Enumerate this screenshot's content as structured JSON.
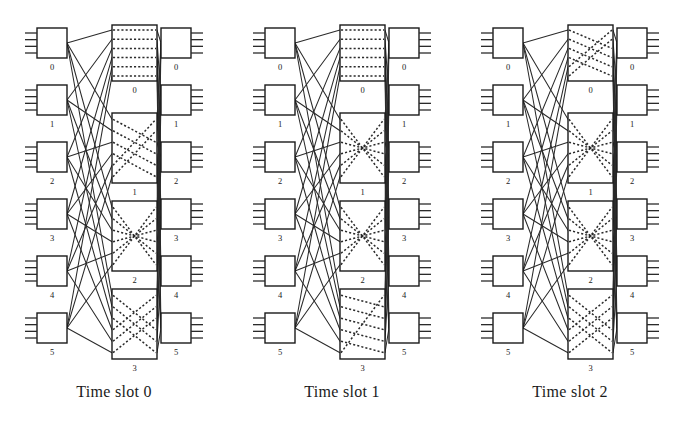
{
  "figure": {
    "type": "three-stage-clos-network-time-slots",
    "background": "#ffffff",
    "line_color": "#2a2a2a",
    "box_fill": "#ffffff",
    "box_stroke": "#1a1a1a",
    "panel_count": 3,
    "width": 684,
    "height": 429
  },
  "labels": {
    "input_module_indices": [
      "0",
      "1",
      "2",
      "3",
      "4",
      "5"
    ],
    "output_module_indices": [
      "0",
      "1",
      "2",
      "3",
      "4",
      "5"
    ],
    "central_module_indices": [
      "0",
      "1",
      "2",
      "3"
    ]
  },
  "panels": [
    {
      "id": "panel-0",
      "caption": "Time slot 0",
      "input_modules": [
        {
          "index": "0",
          "ports": 4
        },
        {
          "index": "1",
          "ports": 4
        },
        {
          "index": "2",
          "ports": 4
        },
        {
          "index": "3",
          "ports": 4
        },
        {
          "index": "4",
          "ports": 4
        },
        {
          "index": "5",
          "ports": 4
        }
      ],
      "central_modules": [
        {
          "index": "0",
          "internal_pattern": "straight",
          "connections": [
            [
              0,
              0
            ],
            [
              1,
              1
            ],
            [
              2,
              2
            ],
            [
              3,
              3
            ],
            [
              4,
              4
            ],
            [
              5,
              5
            ]
          ]
        },
        {
          "index": "1",
          "internal_pattern": "crossed",
          "connections": [
            [
              0,
              2
            ],
            [
              1,
              3
            ],
            [
              2,
              4
            ],
            [
              3,
              5
            ],
            [
              4,
              0
            ],
            [
              5,
              1
            ]
          ]
        },
        {
          "index": "2",
          "internal_pattern": "butterfly",
          "connections": [
            [
              0,
              5
            ],
            [
              1,
              4
            ],
            [
              2,
              3
            ],
            [
              3,
              2
            ],
            [
              4,
              1
            ],
            [
              5,
              0
            ]
          ]
        },
        {
          "index": "3",
          "internal_pattern": "crossed",
          "connections": [
            [
              0,
              3
            ],
            [
              1,
              4
            ],
            [
              2,
              5
            ],
            [
              3,
              0
            ],
            [
              4,
              1
            ],
            [
              5,
              2
            ]
          ]
        }
      ],
      "output_modules": [
        {
          "index": "0",
          "ports": 4
        },
        {
          "index": "1",
          "ports": 4
        },
        {
          "index": "2",
          "ports": 4
        },
        {
          "index": "3",
          "ports": 4
        },
        {
          "index": "4",
          "ports": 4
        },
        {
          "index": "5",
          "ports": 4
        }
      ]
    },
    {
      "id": "panel-1",
      "caption": "Time slot 1",
      "input_modules": [
        {
          "index": "0",
          "ports": 4
        },
        {
          "index": "1",
          "ports": 4
        },
        {
          "index": "2",
          "ports": 4
        },
        {
          "index": "3",
          "ports": 4
        },
        {
          "index": "4",
          "ports": 4
        },
        {
          "index": "5",
          "ports": 4
        }
      ],
      "central_modules": [
        {
          "index": "0",
          "internal_pattern": "straight",
          "connections": [
            [
              0,
              0
            ],
            [
              1,
              1
            ],
            [
              2,
              2
            ],
            [
              3,
              3
            ],
            [
              4,
              4
            ],
            [
              5,
              5
            ]
          ]
        },
        {
          "index": "1",
          "internal_pattern": "butterfly",
          "connections": [
            [
              0,
              5
            ],
            [
              1,
              4
            ],
            [
              2,
              3
            ],
            [
              3,
              2
            ],
            [
              4,
              1
            ],
            [
              5,
              0
            ]
          ]
        },
        {
          "index": "2",
          "internal_pattern": "butterfly",
          "connections": [
            [
              0,
              5
            ],
            [
              1,
              4
            ],
            [
              2,
              3
            ],
            [
              3,
              2
            ],
            [
              4,
              1
            ],
            [
              5,
              0
            ]
          ]
        },
        {
          "index": "3",
          "internal_pattern": "shifted",
          "connections": [
            [
              0,
              1
            ],
            [
              1,
              2
            ],
            [
              2,
              3
            ],
            [
              3,
              4
            ],
            [
              4,
              5
            ],
            [
              5,
              0
            ]
          ]
        }
      ],
      "output_modules": [
        {
          "index": "0",
          "ports": 4
        },
        {
          "index": "1",
          "ports": 4
        },
        {
          "index": "2",
          "ports": 4
        },
        {
          "index": "3",
          "ports": 4
        },
        {
          "index": "4",
          "ports": 4
        },
        {
          "index": "5",
          "ports": 4
        }
      ]
    },
    {
      "id": "panel-2",
      "caption": "Time slot 2",
      "input_modules": [
        {
          "index": "0",
          "ports": 4
        },
        {
          "index": "1",
          "ports": 4
        },
        {
          "index": "2",
          "ports": 4
        },
        {
          "index": "3",
          "ports": 4
        },
        {
          "index": "4",
          "ports": 4
        },
        {
          "index": "5",
          "ports": 4
        }
      ],
      "central_modules": [
        {
          "index": "0",
          "internal_pattern": "crossed",
          "connections": [
            [
              0,
              2
            ],
            [
              1,
              3
            ],
            [
              2,
              4
            ],
            [
              3,
              5
            ],
            [
              4,
              0
            ],
            [
              5,
              1
            ]
          ]
        },
        {
          "index": "1",
          "internal_pattern": "butterfly",
          "connections": [
            [
              0,
              5
            ],
            [
              1,
              4
            ],
            [
              2,
              3
            ],
            [
              3,
              2
            ],
            [
              4,
              1
            ],
            [
              5,
              0
            ]
          ]
        },
        {
          "index": "2",
          "internal_pattern": "butterfly",
          "connections": [
            [
              0,
              5
            ],
            [
              1,
              4
            ],
            [
              2,
              3
            ],
            [
              3,
              2
            ],
            [
              4,
              1
            ],
            [
              5,
              0
            ]
          ]
        },
        {
          "index": "3",
          "internal_pattern": "crossed",
          "connections": [
            [
              0,
              3
            ],
            [
              1,
              4
            ],
            [
              2,
              5
            ],
            [
              3,
              0
            ],
            [
              4,
              1
            ],
            [
              5,
              2
            ]
          ]
        }
      ],
      "output_modules": [
        {
          "index": "0",
          "ports": 4
        },
        {
          "index": "1",
          "ports": 4
        },
        {
          "index": "2",
          "ports": 4
        },
        {
          "index": "3",
          "ports": 4
        },
        {
          "index": "4",
          "ports": 4
        },
        {
          "index": "5",
          "ports": 4
        }
      ]
    }
  ]
}
